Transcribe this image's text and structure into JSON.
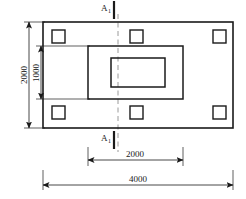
{
  "drawing": {
    "type": "structural-plan-view",
    "background_color": "#ffffff",
    "line_color": "#1a1a1a",
    "centerline_color": "#9a9a9a",
    "section_marks": {
      "top": {
        "letter": "A",
        "subscript": "1"
      },
      "bottom": {
        "letter": "A",
        "subscript": "1"
      }
    },
    "dimensions": {
      "vertical_outer": {
        "value": "2000",
        "orientation": "vertical"
      },
      "vertical_inner": {
        "value": "1000",
        "orientation": "vertical"
      },
      "horizontal_inner": {
        "value": "2000",
        "orientation": "horizontal"
      },
      "horizontal_outer": {
        "value": "4000",
        "orientation": "horizontal"
      }
    },
    "shapes": {
      "outer_rectangle": {
        "x": 43,
        "y": 22,
        "w": 190,
        "h": 106
      },
      "middle_rectangle": {
        "x": 88,
        "y": 46,
        "w": 95,
        "h": 53
      },
      "inner_rectangle": {
        "x": 111,
        "y": 58,
        "w": 54,
        "h": 29
      },
      "columns": [
        {
          "name": "top-left",
          "x": 52,
          "y": 30
        },
        {
          "name": "top-middle",
          "x": 130,
          "y": 30
        },
        {
          "name": "top-right",
          "x": 213,
          "y": 30
        },
        {
          "name": "bottom-left",
          "x": 52,
          "y": 106
        },
        {
          "name": "bottom-middle",
          "x": 130,
          "y": 106
        },
        {
          "name": "bottom-right",
          "x": 213,
          "y": 106
        }
      ],
      "column_size": 13,
      "centerline_x": 118
    }
  }
}
